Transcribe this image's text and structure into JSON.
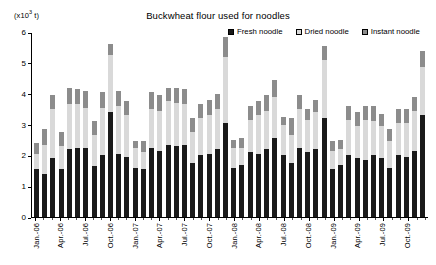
{
  "chart_data": {
    "type": "bar",
    "subtype": "stacked-bar",
    "title": "Buckwheat flour used for noodles",
    "unit_label": "(x10",
    "unit_exponent": "3",
    "unit_suffix": " t)",
    "xlabel": "",
    "ylabel": "",
    "ylim": [
      0,
      6
    ],
    "y_ticks": [
      0,
      1,
      2,
      3,
      4,
      5,
      6
    ],
    "y_tick_labels": [
      "0",
      "1",
      "2",
      "3",
      "4",
      "5",
      "6"
    ],
    "grid": false,
    "legend_position": "top-right",
    "legend": [
      "Fresh noodle",
      "Dried noodle",
      "Instant noodle"
    ],
    "series_colors": [
      "#1a1a1a",
      "#d9d9d9",
      "#8c8c8c"
    ],
    "categories": [
      "Jan.-06",
      "Feb.-06",
      "Mar.-06",
      "Apr.-06",
      "May-06",
      "Jun.-06",
      "Jul.-06",
      "Aug.-06",
      "Sep.-06",
      "Oct.-06",
      "Nov.-06",
      "Dec.-06",
      "Jan.-07",
      "Feb.-07",
      "Mar.-07",
      "Apr.-07",
      "May-07",
      "Jun.-07",
      "Jul.-07",
      "Aug.-07",
      "Sep.-07",
      "Oct.-07",
      "Nov.-07",
      "Dec.-07",
      "Jan.-08",
      "Feb.-08",
      "Mar.-08",
      "Apr.-08",
      "May-08",
      "Jun.-08",
      "Jul.-08",
      "Aug.-08",
      "Sep.-08",
      "Oct.-08",
      "Nov.-08",
      "Dec.-08",
      "Jan.-09",
      "Feb.-09",
      "Mar.-09",
      "Apr.-09",
      "May-09",
      "Jun.-09",
      "Jul.-09",
      "Aug.-09",
      "Sep.-09",
      "Oct.-09",
      "Nov.-09",
      "Dec.-09"
    ],
    "x_tick_labels": [
      {
        "index": 0,
        "label": "Jan.-06"
      },
      {
        "index": 3,
        "label": "Apr.-06"
      },
      {
        "index": 6,
        "label": "Jul.-06"
      },
      {
        "index": 9,
        "label": "Oct.-06"
      },
      {
        "index": 12,
        "label": "Jan.-07"
      },
      {
        "index": 15,
        "label": "Apr.-07"
      },
      {
        "index": 18,
        "label": "Jul.-07"
      },
      {
        "index": 21,
        "label": "Oct.-07"
      },
      {
        "index": 24,
        "label": "Jan.-08"
      },
      {
        "index": 27,
        "label": "Apr.-08"
      },
      {
        "index": 30,
        "label": "Jul.-08"
      },
      {
        "index": 33,
        "label": "Oct.-08"
      },
      {
        "index": 36,
        "label": "Jan.-09"
      },
      {
        "index": 39,
        "label": "Apr.-09"
      },
      {
        "index": 42,
        "label": "Jul.-09"
      },
      {
        "index": 45,
        "label": "Oct.-09"
      }
    ],
    "series": [
      {
        "name": "Fresh noodle",
        "color": "#1a1a1a",
        "values": [
          1.55,
          1.4,
          1.9,
          1.55,
          2.2,
          2.25,
          2.25,
          1.65,
          2.0,
          3.4,
          2.05,
          1.95,
          1.6,
          1.55,
          2.25,
          2.15,
          2.35,
          2.3,
          2.35,
          1.75,
          2.0,
          2.05,
          2.2,
          3.05,
          1.6,
          1.7,
          2.1,
          2.05,
          2.2,
          2.55,
          2.0,
          1.75,
          2.25,
          2.1,
          2.2,
          3.2,
          1.55,
          1.7,
          2.0,
          1.9,
          1.85,
          2.0,
          1.9,
          1.6,
          2.0,
          1.95,
          2.15,
          3.3
        ]
      },
      {
        "name": "Dried noodle",
        "color": "#d9d9d9",
        "values": [
          0.5,
          0.95,
          1.6,
          0.75,
          1.45,
          1.4,
          1.3,
          1.0,
          1.55,
          1.85,
          1.55,
          1.35,
          0.65,
          0.55,
          1.25,
          1.3,
          1.4,
          1.4,
          1.3,
          1.0,
          1.2,
          1.25,
          1.3,
          2.15,
          0.65,
          0.55,
          1.05,
          1.25,
          1.25,
          1.35,
          1.0,
          0.9,
          1.25,
          1.05,
          1.2,
          1.9,
          0.6,
          0.5,
          1.15,
          1.05,
          1.3,
          1.1,
          1.05,
          0.85,
          1.05,
          1.1,
          1.3,
          1.55
        ]
      },
      {
        "name": "Instant noodle",
        "color": "#8c8c8c",
        "values": [
          0.35,
          0.5,
          0.45,
          0.45,
          0.55,
          0.5,
          0.55,
          0.45,
          0.5,
          0.35,
          0.5,
          0.45,
          0.2,
          0.35,
          0.55,
          0.5,
          0.45,
          0.5,
          0.5,
          0.45,
          0.45,
          0.5,
          0.5,
          0.65,
          0.25,
          0.3,
          0.45,
          0.45,
          0.5,
          0.55,
          0.25,
          0.55,
          0.45,
          0.35,
          0.4,
          0.45,
          0.3,
          0.3,
          0.45,
          0.45,
          0.45,
          0.5,
          0.4,
          0.4,
          0.45,
          0.45,
          0.45,
          0.55
        ]
      }
    ]
  }
}
